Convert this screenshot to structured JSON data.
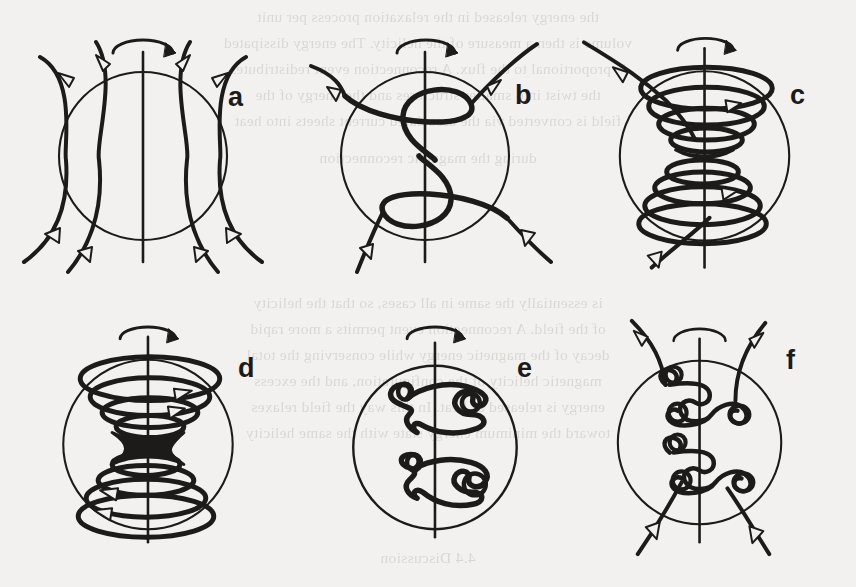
{
  "figure": {
    "layout": "2 rows x 3 columns",
    "background_color": "#f3f1ef",
    "ink_color": "#1d1b19",
    "source_medium": "scanned book page with reverse-side bleed-through"
  },
  "panels": [
    {
      "label": "a",
      "name": "panel-a",
      "description": "Sphere with open meridional (poloidal) field lines threading through, arrowheads pointing outward along each line; vertical rotation axis and curved rotation arrow at top",
      "features": [
        "sphere-outline",
        "rotation-axis",
        "rotation-arrow",
        "open-field-lines",
        "arrowheads"
      ],
      "field_line_count": 4,
      "arrowhead_count": 8
    },
    {
      "label": "b",
      "name": "panel-b",
      "description": "Field lines wound once about the rotation axis forming an S-shaped helix with one toroidal loop in each hemisphere; line ends still open outside the sphere",
      "features": [
        "sphere-outline",
        "rotation-axis",
        "rotation-arrow",
        "helical-twist",
        "open-field-lines",
        "arrowheads"
      ],
      "turns_per_hemisphere": 1,
      "arrowhead_count": 4
    },
    {
      "label": "c",
      "name": "panel-c",
      "description": "Increased winding: three tight toroidal turns stacked in each hemisphere forming funnel-shaped coils that pinch toward the equator; a single open line still exits top-left and bottom-left",
      "features": [
        "sphere-outline",
        "rotation-axis",
        "rotation-arrow",
        "stacked-coils",
        "open-field-lines",
        "arrowheads"
      ],
      "turns_per_hemisphere": 3,
      "arrowhead_count": 4
    },
    {
      "label": "d",
      "name": "panel-d",
      "description": "Fully wound state: closed toroidal coil stacks in both hemispheres meeting at a dark X-point / current sheet at the equator where reconnection occurs; directional arrows on the rings",
      "features": [
        "sphere-outline",
        "rotation-axis",
        "rotation-arrow",
        "closed-coils",
        "reconnection-x-point",
        "direction-arrows"
      ],
      "turns_per_hemisphere": 3,
      "reconnection_point": "equator"
    },
    {
      "label": "e",
      "name": "panel-e",
      "description": "After reconnection: two detached closed flux ropes, one per hemisphere, each an irregular kinked loop carrying small knot-like sub-loops; no lines cross the sphere surface",
      "features": [
        "sphere-outline",
        "rotation-axis",
        "rotation-arrow",
        "detached-flux-ropes",
        "knots",
        "closed-loops"
      ],
      "flux_rope_count": 2
    },
    {
      "label": "f",
      "name": "panel-f",
      "description": "Open field lines re-established through the knotted structures: twisted knotted loops remain about the axis while field lines again emerge from the poles with outward arrowheads",
      "features": [
        "sphere-outline",
        "rotation-axis",
        "rotation-arrow",
        "knots",
        "open-field-lines",
        "arrowheads"
      ],
      "arrowhead_count": 4
    }
  ],
  "ghost_text": {
    "note": "faint mirrored text showing through from the reverse page",
    "lines": [
      "the energy released in the relaxation process per unit",
      "volume is then a measure of the helicity. The energy dissipated",
      "is proportional to the flux. A reconnection event redistributes",
      "the twist into smaller structures and the energy of the",
      "field is converted via the associated current sheets into heat",
      "during the magnetic reconnection",
      "is essentially the same in all cases, so that the helicity",
      "of the field. A reconnection event permits a more rapid",
      "decay of the magnetic energy while conserving the total",
      "magnetic helicity of the configuration, and the excess",
      "energy is released as heat. In this way the field relaxes",
      "toward the minimum energy state with the same helicity",
      "4.4 Discussion"
    ]
  }
}
